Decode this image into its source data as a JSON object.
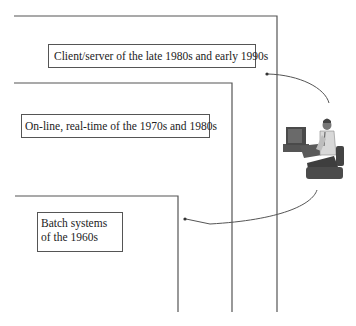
{
  "diagram": {
    "layers": [
      {
        "id": "client-server",
        "label": "Client/server of the late 1980s and early 1990s"
      },
      {
        "id": "online-realtime",
        "label": "On-line, real-time of the 1970s and 1980s"
      },
      {
        "id": "batch",
        "label_line1": "Batch systems",
        "label_line2": "of the 1960s"
      }
    ],
    "figure": "user-at-computer",
    "colors": {
      "line": "#555555",
      "text": "#222222",
      "background": "#ffffff"
    }
  }
}
